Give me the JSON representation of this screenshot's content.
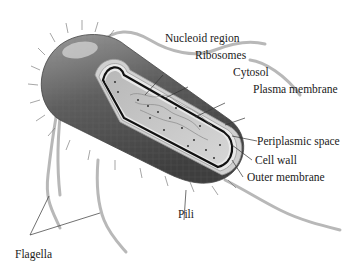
{
  "figure": {
    "palette": {
      "ink": "#1a1a1a",
      "body_dark": "#555555",
      "body_mid": "#8a8a8a",
      "cytosol": "#c9c9c9",
      "flagella": "#b5b5b5",
      "background": "#ffffff"
    },
    "labels": {
      "nucleoid_region": "Nucleoid region",
      "ribosomes": "Ribosomes",
      "cytosol": "Cytosol",
      "plasma_membrane": "Plasma membrane",
      "periplasmic_space": "Periplasmic space",
      "cell_wall": "Cell wall",
      "outer_membrane": "Outer membrane",
      "pili": "Pili",
      "flagella": "Flagella"
    }
  }
}
